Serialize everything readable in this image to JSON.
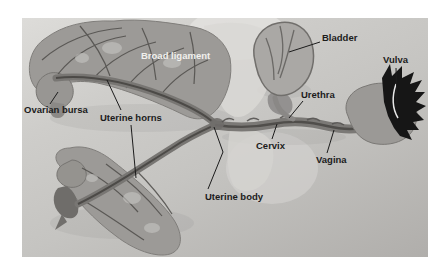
{
  "page": {
    "background": "#ffffff"
  },
  "figure": {
    "description": "Dissected female reproductive tract specimen photographed on a gray mat, with labelled anatomy and leader lines",
    "photo_background": "#c5c4c1"
  },
  "labels": [
    {
      "id": "broad-ligament",
      "text": "Broad ligament",
      "style": "light"
    },
    {
      "id": "bladder",
      "text": "Bladder",
      "style": "dark"
    },
    {
      "id": "vulva",
      "text": "Vulva",
      "style": "dark"
    },
    {
      "id": "ovarian-bursa",
      "text": "Ovarian bursa",
      "style": "dark"
    },
    {
      "id": "urethra",
      "text": "Urethra",
      "style": "dark"
    },
    {
      "id": "uterine-horns",
      "text": "Uterine horns",
      "style": "dark"
    },
    {
      "id": "cervix",
      "text": "Cervix",
      "style": "dark"
    },
    {
      "id": "vagina",
      "text": "Vagina",
      "style": "dark"
    },
    {
      "id": "uterine-body",
      "text": "Uterine body",
      "style": "dark"
    }
  ],
  "colors": {
    "label_dark": "#1c1c1c",
    "label_light": "#f1f0ed",
    "tissue": "#9c9a97",
    "tissue_pale": "#d9d8d5",
    "vessel": "#4f4d4a",
    "tube": "#787673",
    "fur_black": "#161616",
    "mat_gray": "#c5c4c1"
  }
}
